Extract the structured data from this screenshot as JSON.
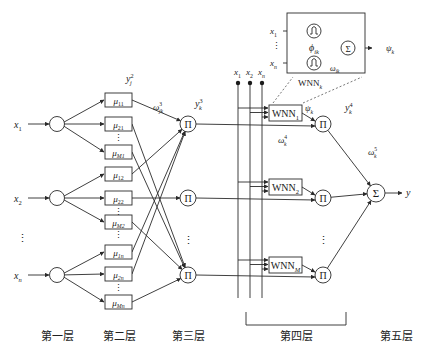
{
  "inputs": [
    {
      "base": "x",
      "sub": "1"
    },
    {
      "base": "x",
      "sub": "2"
    },
    {
      "base": "x",
      "sub": "n"
    }
  ],
  "input_ellipsis": "⋮",
  "layer2": {
    "groups": [
      [
        {
          "base": "μ",
          "sub": "11"
        },
        {
          "base": "μ",
          "sub": "21"
        },
        {
          "base": "μ",
          "sub": "M1"
        }
      ],
      [
        {
          "base": "μ",
          "sub": "12"
        },
        {
          "base": "μ",
          "sub": "22"
        },
        {
          "base": "μ",
          "sub": "M2"
        }
      ],
      [
        {
          "base": "μ",
          "sub": "1n"
        },
        {
          "base": "μ",
          "sub": "2n"
        },
        {
          "base": "μ",
          "sub": "Mn"
        }
      ]
    ],
    "output_label": {
      "base": "y",
      "sub": "j",
      "sup": "2"
    },
    "weight_label": {
      "base": "ω",
      "sub": "jk",
      "sup": "3"
    }
  },
  "layer3": {
    "node_symbol": "Π",
    "output_label": {
      "base": "y",
      "sub": "k",
      "sup": "3"
    },
    "ellipsis": "⋮"
  },
  "bus_inputs": [
    {
      "base": "x",
      "sub": "1"
    },
    {
      "base": "x",
      "sub": "2"
    },
    {
      "base": "x",
      "sub": "n"
    }
  ],
  "layer4": {
    "wnn_units": [
      {
        "base": "WNN",
        "sub": "1"
      },
      {
        "base": "WNN",
        "sub": "2"
      },
      {
        "base": "WNN",
        "sub": "M"
      }
    ],
    "wnn_output": {
      "base": "ψ",
      "sub": "k"
    },
    "weight_label": {
      "base": "ω",
      "sub": "k",
      "sup": "4"
    },
    "product_symbol": "Π",
    "output_label": {
      "base": "y",
      "sub": "k",
      "sup": "4"
    },
    "ellipsis": "⋮"
  },
  "inset": {
    "title": {
      "base": "WNN",
      "sub": "k"
    },
    "inputs": [
      {
        "base": "x",
        "sub": "1"
      },
      {
        "base": "x",
        "sub": "n"
      }
    ],
    "wavelet_label": {
      "base": "ϕ",
      "sub": "ik"
    },
    "weight_label": {
      "base": "ω",
      "sub": "ik"
    },
    "sum_symbol": "Σ",
    "output": {
      "base": "ψ",
      "sub": "k"
    },
    "ellipsis": "⋮"
  },
  "layer5": {
    "sum_symbol": "Σ",
    "weight_label": {
      "base": "ω",
      "sub": "k",
      "sup": "5"
    },
    "output": "y"
  },
  "layer_labels": [
    "第一层",
    "第二层",
    "第三层",
    "第四层",
    "第五层"
  ]
}
